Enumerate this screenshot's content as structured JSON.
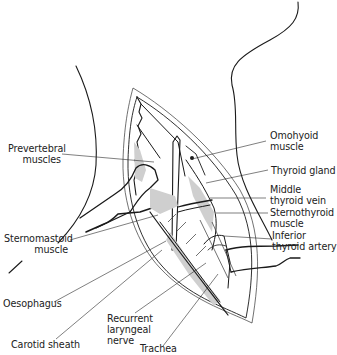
{
  "figure": {
    "type": "anatomical line drawing",
    "colors": {
      "ink": "#1a1a1a",
      "shading": "#cfcfcf",
      "background": "#ffffff"
    }
  },
  "labels": {
    "prevertebral": {
      "line1": "Prevertebral",
      "line2": "muscles"
    },
    "sternomastoid": {
      "line1": "Sternomastoid",
      "line2": "muscle"
    },
    "oesophagus": {
      "line1": "Oesophagus"
    },
    "carotid": {
      "line1": "Carotid sheath"
    },
    "recurrent": {
      "line1": "Recurrent",
      "line2": "laryngeal",
      "line3": "nerve"
    },
    "trachea": {
      "line1": "Trachea"
    },
    "omohyoid": {
      "line1": "Omohyoid",
      "line2": "muscle"
    },
    "thyroid_gland": {
      "line1": "Thyroid gland"
    },
    "middle_vein": {
      "line1": "Middle",
      "line2": "thyroid vein"
    },
    "sternothyroid": {
      "line1": "Sternothyroid",
      "line2": "muscle"
    },
    "inferior_artery": {
      "line1": "Inferior",
      "line2": "thyroid artery"
    }
  }
}
